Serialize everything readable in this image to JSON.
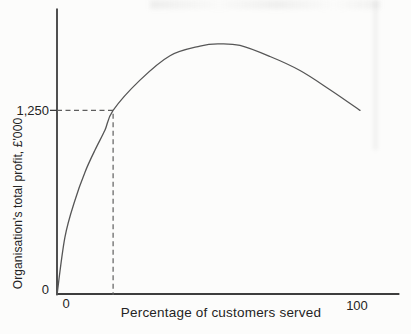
{
  "chart": {
    "labels": {
      "y_tick": "1,250",
      "y_origin": "0",
      "x_origin": "0",
      "x_max": "100",
      "xlabel": "Percentage of customers served",
      "ylabel": "Organisation's total profit, £'000"
    }
  },
  "chart_data": {
    "type": "line",
    "title": "",
    "xlabel": "Percentage of customers served",
    "ylabel": "Organisation's total profit, £'000",
    "xlim": [
      0,
      113
    ],
    "ylim": [
      0,
      1940
    ],
    "x_ticks": [
      0,
      100
    ],
    "y_ticks": [
      0,
      1250
    ],
    "grid": false,
    "legend": false,
    "series": [
      {
        "name": "Total profit curve",
        "x": [
          0,
          2.6,
          5.9,
          9.2,
          12.5,
          15.8,
          18.5,
          27.4,
          37.3,
          47.2,
          53.1,
          60.4,
          70.3,
          80.2,
          90.1,
          100
        ],
        "y": [
          0,
          390,
          640,
          830,
          980,
          1115,
          1250,
          1455,
          1620,
          1685,
          1700,
          1690,
          1615,
          1520,
          1390,
          1250
        ]
      }
    ],
    "annotations": {
      "dashed_guides": {
        "x": 18.5,
        "y": 1250
      }
    }
  },
  "colors": {
    "background": "#fcfcfb",
    "axis": "#3d3d3d",
    "curve": "#565656",
    "dashed": "#5e5e5e",
    "text": "#242424"
  }
}
